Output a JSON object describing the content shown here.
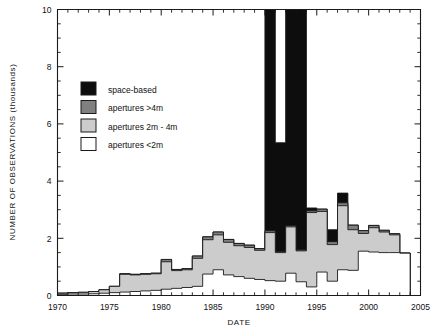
{
  "chart_data": {
    "type": "area",
    "subtype": "stacked-step-area",
    "title": "",
    "xlabel": "DATE",
    "ylabel": "NUMBER OF OBSERVATIONS (thousands)",
    "xlim": [
      1970,
      2005
    ],
    "ylim": [
      0,
      10
    ],
    "xticks": [
      1970,
      1975,
      1980,
      1985,
      1990,
      1995,
      2000,
      2005
    ],
    "xticklabels": [
      "1970",
      "1975",
      "1980",
      "1985",
      "1990",
      "1995",
      "2000",
      "2005"
    ],
    "xminor_step": 1,
    "yticks": [
      0,
      2,
      4,
      6,
      8,
      10
    ],
    "yticklabels": [
      "0",
      "2",
      "4",
      "6",
      "8",
      "10"
    ],
    "yminor_step": 0.5,
    "grid": false,
    "legend_position": "upper-left-inside",
    "note": "Values in thousands of observations; the space-based series is clipped by the top of the axis in 1990-1993.",
    "x": [
      1970,
      1971,
      1972,
      1973,
      1974,
      1975,
      1976,
      1977,
      1978,
      1979,
      1980,
      1981,
      1982,
      1983,
      1984,
      1985,
      1986,
      1987,
      1988,
      1989,
      1990,
      1991,
      1992,
      1993,
      1994,
      1995,
      1996,
      1997,
      1998,
      1999,
      2000,
      2001,
      2002,
      2003
    ],
    "series": [
      {
        "name": "apertures <2m",
        "color": "#ffffff",
        "values": [
          0.04,
          0.05,
          0.05,
          0.06,
          0.08,
          0.1,
          0.12,
          0.14,
          0.16,
          0.18,
          0.22,
          0.25,
          0.28,
          0.32,
          0.75,
          0.9,
          0.72,
          0.66,
          0.6,
          0.56,
          0.52,
          0.5,
          0.78,
          0.48,
          0.3,
          0.82,
          0.5,
          0.9,
          0.88,
          1.55,
          1.52,
          1.5,
          1.5,
          1.48
        ]
      },
      {
        "name": "apertures 2m - 4m",
        "color": "#cccccc",
        "values": [
          0.04,
          0.05,
          0.06,
          0.08,
          0.12,
          0.22,
          0.62,
          0.58,
          0.58,
          0.58,
          0.96,
          0.62,
          0.62,
          0.98,
          1.2,
          1.22,
          1.14,
          1.08,
          1.08,
          1.02,
          1.68,
          1.0,
          1.62,
          1.08,
          2.6,
          2.12,
          1.28,
          2.24,
          1.42,
          0.62,
          0.85,
          0.72,
          0.62,
          0.0
        ]
      },
      {
        "name": "apertures >4m",
        "color": "#808080",
        "values": [
          0.0,
          0.0,
          0.0,
          0.0,
          0.0,
          0.0,
          0.02,
          0.02,
          0.02,
          0.02,
          0.08,
          0.04,
          0.04,
          0.08,
          0.1,
          0.1,
          0.1,
          0.08,
          0.08,
          0.06,
          0.06,
          0.04,
          0.04,
          0.04,
          0.06,
          0.08,
          0.1,
          0.1,
          0.16,
          0.1,
          0.08,
          0.06,
          0.04,
          0.0
        ]
      },
      {
        "name": "space-based",
        "color": "#0d0d0d",
        "values": [
          0.0,
          0.0,
          0.0,
          0.0,
          0.0,
          0.0,
          0.0,
          0.0,
          0.0,
          0.0,
          0.0,
          0.0,
          0.0,
          0.0,
          0.0,
          0.0,
          0.0,
          0.0,
          0.0,
          0.0,
          10.4,
          3.8,
          10.4,
          10.4,
          0.1,
          0.0,
          0.42,
          0.34,
          0.0,
          0.0,
          0.0,
          0.0,
          0.0,
          0.0
        ]
      }
    ],
    "legend": [
      {
        "label": "space-based",
        "color": "#0d0d0d"
      },
      {
        "label": "apertures >4m",
        "color": "#808080"
      },
      {
        "label": "apertures 2m  -  4m",
        "color": "#cccccc"
      },
      {
        "label": "apertures <2m",
        "color": "#ffffff"
      }
    ]
  }
}
